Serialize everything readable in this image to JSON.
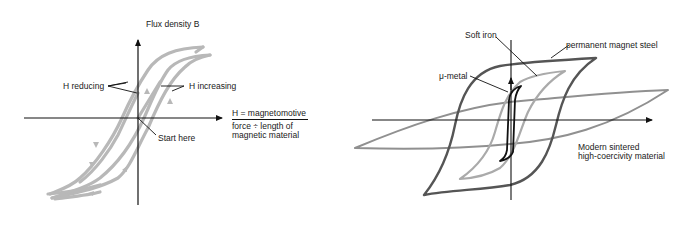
{
  "left_diagram": {
    "y_axis_label": "Flux density B",
    "x_axis_label_line1": "H = magnetomotive",
    "x_axis_label_line2": "force ÷ length of",
    "x_axis_label_line3": "magnetic material",
    "annotations": {
      "h_reducing": "H reducing",
      "h_increasing": "H increasing",
      "start_here": "Start here"
    },
    "loop_color": "#b8b8b8"
  },
  "right_diagram": {
    "labels": {
      "soft_iron": "Soft iron",
      "permanent_magnet_steel": "permanent magnet steel",
      "mu_metal": "μ-metal",
      "modern_sintered_line1": "Modern sintered",
      "modern_sintered_line2": "high-coercivity material"
    },
    "colors": {
      "permanent_magnet_steel": "#555555",
      "soft_iron": "#aaaaaa",
      "mu_metal": "#111111",
      "sintered": "#888888"
    }
  }
}
